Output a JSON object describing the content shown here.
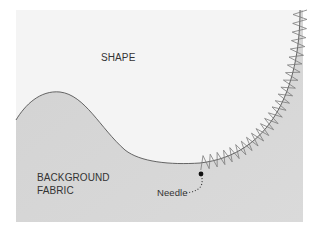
{
  "diagram": {
    "labels": {
      "shape": "SHAPE",
      "background_line1": "BACKGROUND",
      "background_line2": "FABRIC",
      "needle": "Needle"
    },
    "colors": {
      "shape_fill": "#f4f4f4",
      "fabric_fill": "#d6d6d6",
      "outline": "#555555",
      "stitch": "#777777",
      "needle_dot": "#111111"
    }
  }
}
